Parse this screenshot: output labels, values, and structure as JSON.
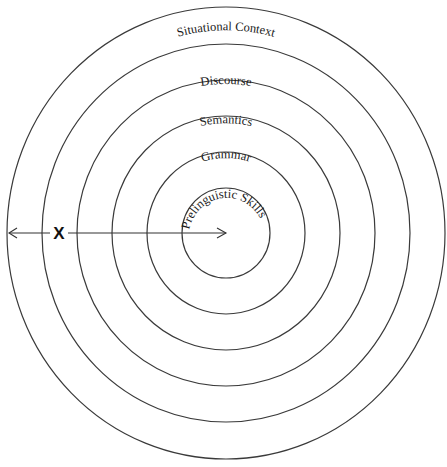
{
  "diagram": {
    "type": "concentric-circles",
    "center": {
      "x": 226,
      "y": 233
    },
    "rings": [
      {
        "label": "Cultural and Subcultural Context",
        "rx": 219,
        "ry": 226
      },
      {
        "label": "Situational Context",
        "rx": 184,
        "ry": 189
      },
      {
        "label": "Discourse",
        "rx": 149,
        "ry": 153
      },
      {
        "label": "Semantics",
        "rx": 114,
        "ry": 117
      },
      {
        "label": "Grammar",
        "rx": 79,
        "ry": 81
      },
      {
        "label": "Prelinguistic Skills",
        "rx": 44,
        "ry": 45
      }
    ],
    "axis_marker": {
      "label": "X",
      "description": "double-headed arrow from outer edge to center"
    }
  }
}
